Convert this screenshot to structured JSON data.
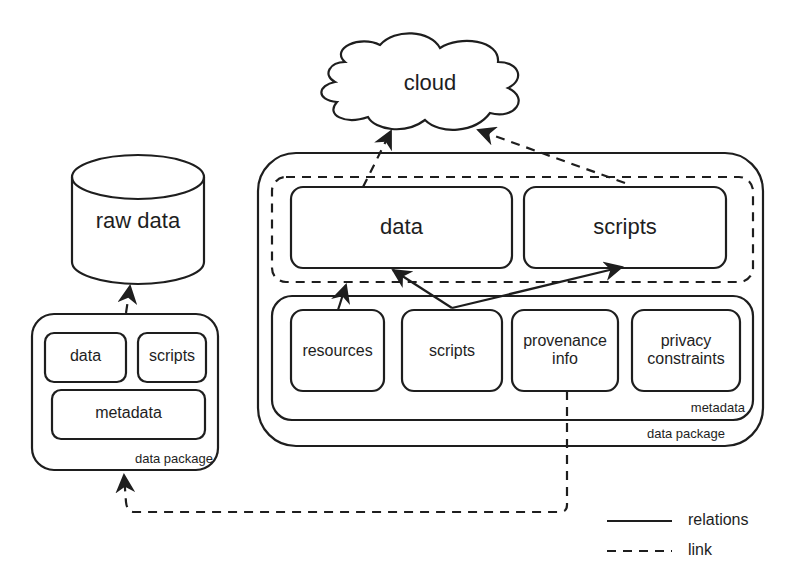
{
  "diagram": {
    "cloud": {
      "label": "cloud"
    },
    "raw_data": {
      "label": "raw data"
    },
    "left_package": {
      "caption": "data package",
      "items": {
        "data": "data",
        "scripts": "scripts",
        "metadata": "metadata"
      }
    },
    "right_package": {
      "caption": "data package",
      "top_items": {
        "data": "data",
        "scripts": "scripts"
      },
      "metadata": {
        "caption": "metadata",
        "items": {
          "resources": "resources",
          "scripts": "scripts",
          "provenance": "provenance info",
          "privacy": "privacy constraints"
        }
      }
    },
    "legend": {
      "relations": "relations",
      "link": "link"
    },
    "colors": {
      "stroke": "#1e1e1e",
      "background": "#ffffff"
    }
  }
}
